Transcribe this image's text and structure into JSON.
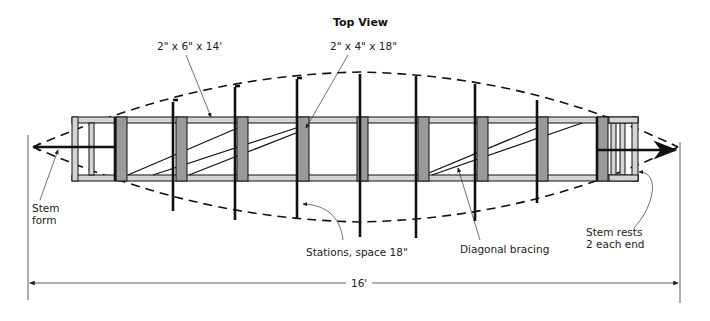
{
  "title": "Top View",
  "callouts": {
    "rail": "2\" x 6\" x 14'",
    "crossmember": "2\" x 4\" x 18\"",
    "stem_form_line1": "Stem",
    "stem_form_line2": "form",
    "stations": "Stations, space 18\"",
    "bracing": "Diagonal bracing",
    "stem_rests_line1": "Stem rests",
    "stem_rests_line2": "2 each end"
  },
  "dimension": {
    "overall_length": "16'"
  },
  "colors": {
    "line": "#111111",
    "rail_fill": "#d4d4d4",
    "block_fill": "#9a9a9a",
    "background": "#ffffff"
  }
}
